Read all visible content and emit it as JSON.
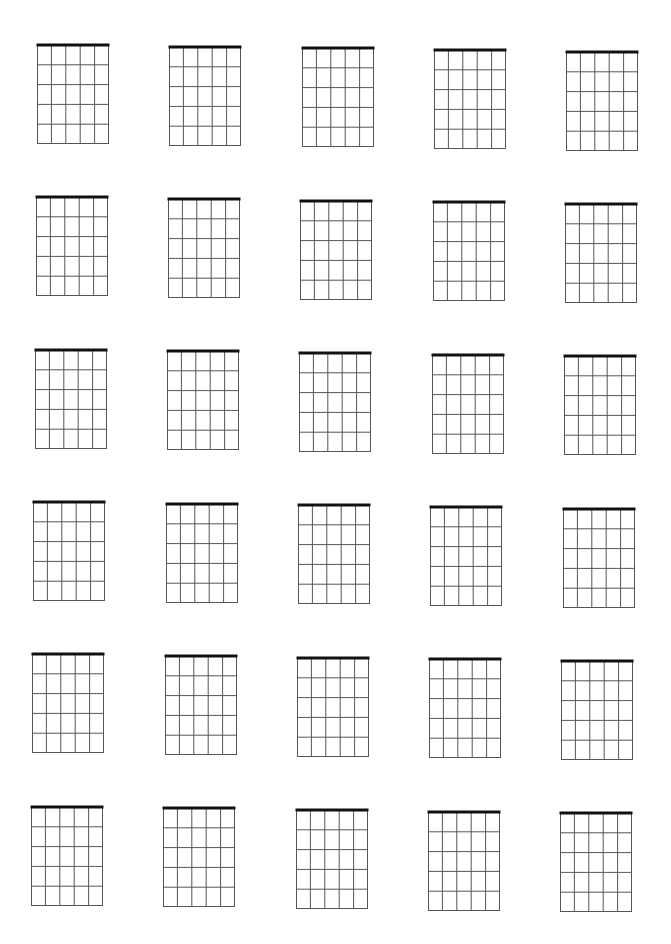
{
  "sheet": {
    "title": "",
    "rows": 6,
    "columns": 5,
    "diagram": {
      "strings": 6,
      "frets": 5,
      "width": 72,
      "height": 99,
      "nut": true,
      "line_color": "#555555",
      "nut_color": "#111111"
    },
    "origin": {
      "x": 37,
      "y": 45
    },
    "column_step": {
      "dx": 132.3,
      "dy": 1.7
    },
    "row_step": {
      "dx": -1.2,
      "dy": 152.3
    }
  }
}
